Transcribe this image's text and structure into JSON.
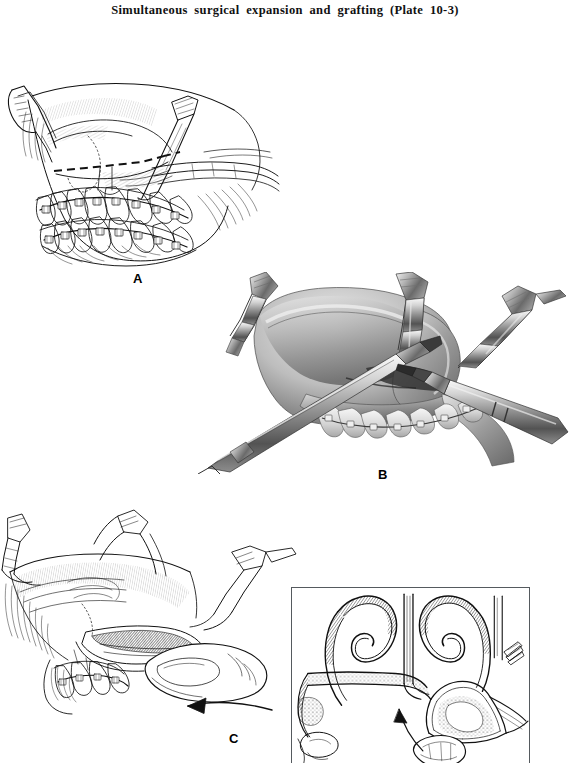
{
  "page": {
    "background_color": "#ffffff",
    "width": 570,
    "height": 763,
    "ink_color": "#000000"
  },
  "title": {
    "text": "Simultaneous surgical expansion and grafting (Plate 10-3)",
    "plate_number": "10-3"
  },
  "figure": {
    "caption_letters": [
      "A",
      "B",
      "C"
    ],
    "panels": [
      {
        "letter": "A",
        "style": "pen-and-ink line drawing",
        "subject": "Lateral view of maxilla and mandible with orthodontic brackets and archwires; dashed Le Fort I osteotomy line; soft-tissue retractors elevating the cheek flap",
        "elements": [
          "upper-dental-arch-with-brackets",
          "lower-dental-arch-with-brackets",
          "dashed-osteotomy-line",
          "upper-retractor",
          "lower-retractor",
          "zygomatic-buttress",
          "soft-tissue-flap"
        ]
      },
      {
        "letter": "B",
        "style": "grayscale tonal wash rendering",
        "subject": "Close-up of the maxilla during surgical separation; an osteotome and a powered handpiece are positioned at the osteotomy site while retractors hold the flap",
        "elements": [
          "osteotome-chisel",
          "surgical-handpiece",
          "left-retractor",
          "right-retractor",
          "exposed-maxilla",
          "maxillary-teeth-with-brackets"
        ]
      },
      {
        "letter": "C",
        "style": "pen-and-ink line drawing",
        "subject": "Down-fractured maxilla being mobilized by digital pressure from the surgeon's thumb; curved arrow indicates direction of advancement",
        "elements": [
          "surgeon-thumb",
          "down-fractured-maxilla",
          "direction-arrow",
          "upper-retractor",
          "lower-retractor",
          "teeth-with-brackets"
        ]
      }
    ],
    "inset": {
      "belongs_to_panel": "C",
      "style": "line drawing, coronal cross-section",
      "subject": "Coronal section through the nasal cavity and maxillary sinuses showing turbinates, nasal septum and the interpositional bone graft being seated; arrow shows insertion direction",
      "elements": [
        "nasal-septum",
        "left-turbinate",
        "right-turbinate",
        "maxillary-sinus",
        "bone-graft-wedge",
        "insertion-arrow",
        "spare-graft-sliver"
      ],
      "border_color": "#555a5e"
    }
  }
}
